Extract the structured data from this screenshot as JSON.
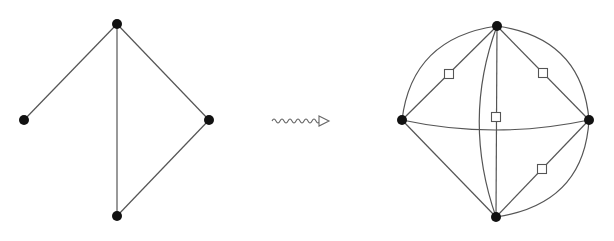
{
  "colors": {
    "edge": "#555555",
    "node": "#111111",
    "square_fill": "#ffffff",
    "square_stroke": "#555555",
    "arrow": "#666666"
  },
  "left_graph": {
    "nodes": [
      {
        "id": "top",
        "x": 117,
        "y": 24
      },
      {
        "id": "left",
        "x": 24,
        "y": 120
      },
      {
        "id": "right",
        "x": 209,
        "y": 120
      },
      {
        "id": "bottom",
        "x": 117,
        "y": 216
      }
    ],
    "edges": [
      [
        "top",
        "left"
      ],
      [
        "top",
        "bottom"
      ],
      [
        "top",
        "right"
      ],
      [
        "right",
        "bottom"
      ]
    ]
  },
  "transform_arrow": {
    "type": "squiggly-arrow",
    "x1": 272,
    "x2": 329,
    "y": 121
  },
  "right_graph": {
    "nodes": [
      {
        "id": "top",
        "x": 497,
        "y": 26
      },
      {
        "id": "left",
        "x": 402,
        "y": 120
      },
      {
        "id": "right",
        "x": 589,
        "y": 120
      },
      {
        "id": "bottom",
        "x": 496,
        "y": 217
      }
    ],
    "straight_edges": [
      [
        "top",
        "left"
      ],
      [
        "top",
        "right"
      ],
      [
        "top",
        "bottom"
      ],
      [
        "right",
        "bottom"
      ],
      [
        "left",
        "bottom"
      ]
    ],
    "curved_edges": [
      {
        "from": "top",
        "to": "left",
        "d": "M497,26 Q412,38 402,120"
      },
      {
        "from": "top",
        "to": "right",
        "d": "M497,26 Q582,38 589,120"
      },
      {
        "from": "right",
        "to": "bottom",
        "d": "M589,120 Q584,204 496,217"
      },
      {
        "from": "left",
        "to": "right",
        "d": "M402,120 Q495,140 589,120"
      },
      {
        "from": "top",
        "to": "bottom",
        "d": "M497,26 Q462,120 496,217"
      }
    ],
    "squares": [
      {
        "x": 449,
        "y": 74
      },
      {
        "x": 543,
        "y": 73
      },
      {
        "x": 496,
        "y": 117
      },
      {
        "x": 542,
        "y": 169
      }
    ]
  }
}
